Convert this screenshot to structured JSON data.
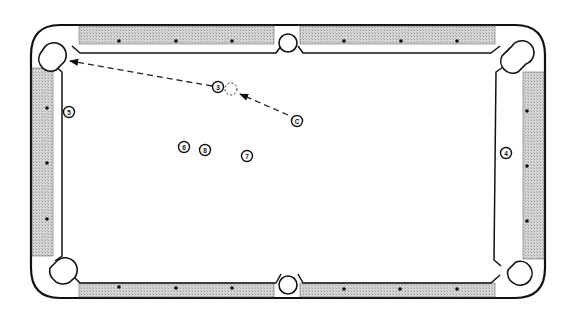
{
  "diagram": {
    "type": "pool-table-shot-diagram",
    "colors": {
      "line": "#111111",
      "rail_hatch": "#c8c8c8",
      "felt": "#ffffff",
      "diamond": "#111111",
      "shot_path": "#222222"
    },
    "balls": [
      {
        "id": "ball-3",
        "label": "3"
      },
      {
        "id": "cue-ball",
        "label": "C"
      },
      {
        "id": "ball-5",
        "label": "5"
      },
      {
        "id": "ball-6",
        "label": "6"
      },
      {
        "id": "ball-8",
        "label": "8"
      },
      {
        "id": "ball-7",
        "label": "7"
      },
      {
        "id": "ball-4",
        "label": "4"
      }
    ],
    "ghost_ball": {
      "label": ""
    },
    "shot": {
      "cue_path": "cue ball to ghost ball (dashed arrow)",
      "object_path": "3 ball to top-left corner pocket (dashed arrow)"
    },
    "pockets": [
      "top-left",
      "top-middle",
      "top-right",
      "bottom-left",
      "bottom-middle",
      "bottom-right"
    ],
    "diamonds_per_long_rail_segment": 3,
    "diamonds_per_short_rail": 3
  }
}
